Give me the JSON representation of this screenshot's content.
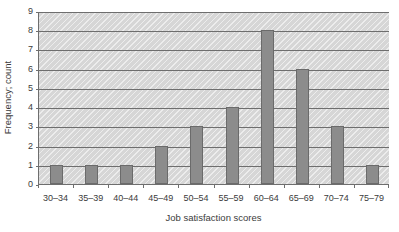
{
  "chart_data": {
    "type": "bar",
    "title": "Skewed distribution",
    "xlabel": "Job satisfaction scores",
    "ylabel": "Frequency; count",
    "categories": [
      "30–34",
      "35–39",
      "40–44",
      "45–49",
      "50–54",
      "55–59",
      "60–64",
      "65–69",
      "70–74",
      "75–79"
    ],
    "values": [
      1,
      1,
      1,
      2,
      3,
      4,
      8,
      6,
      3,
      1
    ],
    "ylim": [
      0,
      9
    ],
    "yticks": [
      0,
      1,
      2,
      3,
      4,
      5,
      6,
      7,
      8,
      9
    ],
    "ytick_labels": [
      "0",
      "1",
      "2",
      "3",
      "4",
      "5",
      "6",
      "7",
      "8",
      "9"
    ],
    "grid": true,
    "grid_axis": "y",
    "legend": false,
    "colors": {
      "bar_fill": "#8c8c8c",
      "bar_edge": "#6b6b6b",
      "plot_background": "#d6d6d6",
      "axis": "#6e6e6e",
      "text": "#3b3b3b",
      "title_text": "#9a9a9a"
    }
  }
}
